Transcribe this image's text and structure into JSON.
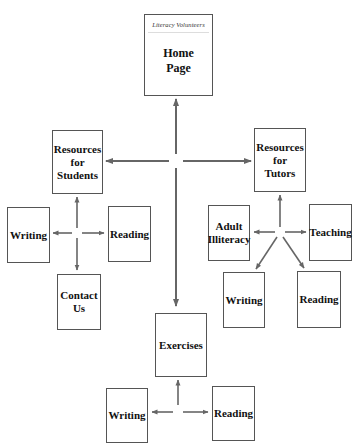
{
  "diagram": {
    "type": "site-map",
    "arrow_color": "#666666",
    "nodes": {
      "home": {
        "banner": "Literacy Volunteers",
        "label": "Home\nPage"
      },
      "res_students": {
        "label": "Resources\nfor\nStudents"
      },
      "res_tutors": {
        "label": "Resources\nfor\nTutors"
      },
      "stu_writing": {
        "label": "Writing"
      },
      "stu_reading": {
        "label": "Reading"
      },
      "contact": {
        "label": "Contact\nUs"
      },
      "tut_adult": {
        "label": "Adult\nIlliteracy"
      },
      "tut_teaching": {
        "label": "Teaching"
      },
      "tut_writing": {
        "label": "Writing"
      },
      "tut_reading": {
        "label": "Reading"
      },
      "exercises": {
        "label": "Exercises"
      },
      "ex_writing": {
        "label": "Writing"
      },
      "ex_reading": {
        "label": "Reading"
      }
    },
    "edges": [
      [
        "hub-main",
        "home"
      ],
      [
        "hub-main",
        "res_students"
      ],
      [
        "hub-main",
        "res_tutors"
      ],
      [
        "hub-main",
        "exercises"
      ],
      [
        "hub-students",
        "res_students"
      ],
      [
        "hub-students",
        "stu_writing"
      ],
      [
        "hub-students",
        "stu_reading"
      ],
      [
        "hub-students",
        "contact"
      ],
      [
        "hub-tutors",
        "res_tutors"
      ],
      [
        "hub-tutors",
        "tut_adult"
      ],
      [
        "hub-tutors",
        "tut_teaching"
      ],
      [
        "hub-tutors",
        "tut_writing"
      ],
      [
        "hub-tutors",
        "tut_reading"
      ],
      [
        "hub-exercises",
        "exercises"
      ],
      [
        "hub-exercises",
        "ex_writing"
      ],
      [
        "hub-exercises",
        "ex_reading"
      ]
    ]
  }
}
